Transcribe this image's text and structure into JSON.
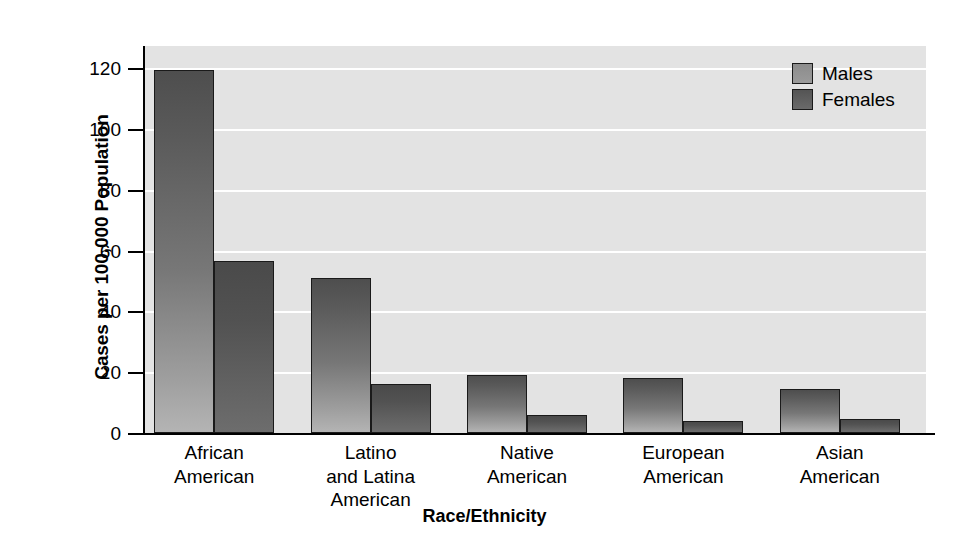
{
  "chart_data": {
    "type": "bar",
    "title": "",
    "subtitle": "",
    "xlabel": "Race/Ethnicity",
    "ylabel": "Cases per 100,000 Population",
    "categories": [
      "African American",
      "Latino and Latina American",
      "Native American",
      "European American",
      "Asian American"
    ],
    "category_label_lines": [
      [
        "African",
        "American"
      ],
      [
        "Latino",
        "and Latina",
        "American"
      ],
      [
        "Native",
        "American"
      ],
      [
        "European",
        "American"
      ],
      [
        "Asian",
        "American"
      ]
    ],
    "series": [
      {
        "name": "Males",
        "values": [
          119.5,
          51,
          19,
          18,
          14.5
        ],
        "color": "#7c7c7c"
      },
      {
        "name": "Females",
        "values": [
          56.5,
          16,
          6,
          4,
          4.5
        ],
        "color": "#555555"
      }
    ],
    "ylim": [
      0,
      126
    ],
    "yticks": [
      0,
      20,
      40,
      60,
      80,
      100,
      120
    ],
    "ytick_labels": [
      "0",
      "20",
      "40",
      "60",
      "80",
      "100",
      "120"
    ],
    "grid": true,
    "gridlines_at": [
      20,
      40,
      60,
      80,
      100,
      120
    ],
    "legend_position": "top-right",
    "plot_background_color": "#e3e3e3",
    "gridline_color": "#ffffff",
    "axis_color": "#000000",
    "page_background_color": "#ffffff"
  }
}
